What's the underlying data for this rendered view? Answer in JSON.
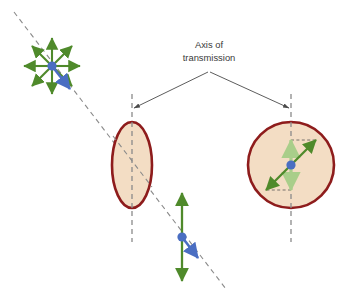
{
  "figure": {
    "title_text_lines": [
      "Axis of",
      "transmission"
    ],
    "label": {
      "line1": "Axis of",
      "line2": "transmission"
    },
    "colors": {
      "arrow_green": "#4f8a2b",
      "arrow_green_faded": "#a9ce8a",
      "dot_blue": "#4a6ec2",
      "polarizer_stroke": "#8e1c1c",
      "polarizer_fill": "#f3ddc4",
      "dashed_gray": "#8a8a8a",
      "leader_line": "#4a4a4a",
      "text": "#3a3a3a",
      "background": "#ffffff"
    },
    "elements": {
      "unpolarized_source": {
        "name": "unpolarized-light-starburst",
        "center_x": 52,
        "center_y": 66,
        "ray_count": 8,
        "ray_length": 28
      },
      "polarizer_edge_on": {
        "name": "polarizer-ellipse",
        "center_x": 132,
        "center_y": 165,
        "rx": 20,
        "ry": 43
      },
      "polarizer_face_on": {
        "name": "polarizer-circle",
        "center_x": 291,
        "center_y": 165,
        "r": 43
      },
      "polarized_light": {
        "name": "polarized-vertical-arrow",
        "center_x": 182,
        "center_y": 237,
        "half_length": 44
      },
      "propagation_axis": {
        "name": "propagation-dashed-line",
        "x1": 14,
        "y1": 12,
        "x2": 226,
        "y2": 289
      },
      "transmission_axis_left": {
        "name": "transmission-axis-left",
        "x": 132,
        "y1": 94,
        "y2": 242
      },
      "transmission_axis_right": {
        "name": "transmission-axis-right",
        "x": 291,
        "y1": 94,
        "y2": 242
      }
    }
  }
}
